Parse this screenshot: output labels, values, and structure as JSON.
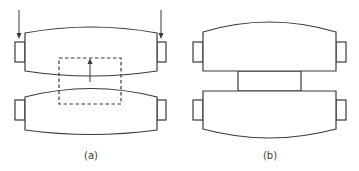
{
  "figure": {
    "panels": [
      {
        "id": "a",
        "label": "(a)",
        "description": "Two separated crowned rolls with downward load arrows on top roll journals and a dashed region with an upward arrow at the roll gap"
      },
      {
        "id": "b",
        "label": "(b)",
        "description": "Two rolls in contact with flat inner faces joined by a rectangular contact zone"
      }
    ],
    "colors": {
      "stroke": "#3a3a3a",
      "background": "#ffffff"
    }
  }
}
